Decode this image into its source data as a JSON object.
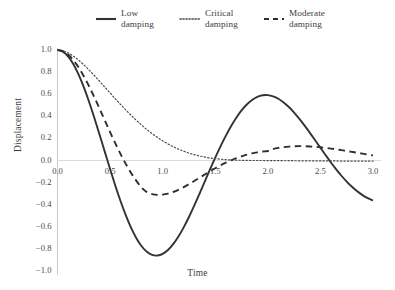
{
  "chart_data": {
    "type": "line",
    "title": "",
    "subtitle": "",
    "xlabel": "Time",
    "ylabel": "Displacement",
    "xlim": [
      0.0,
      3.0
    ],
    "ylim": [
      -1.0,
      1.0
    ],
    "grid": false,
    "zero_line": true,
    "legend_position": "top-center",
    "xticks": [
      "0.0",
      "0.5",
      "1.0",
      "1.5",
      "2.0",
      "2.5",
      "3.0"
    ],
    "xtick_values": [
      0.0,
      0.5,
      1.0,
      1.5,
      2.0,
      2.5,
      3.0
    ],
    "yticks": [
      "1.0",
      "0.8",
      "0.6",
      "0.4",
      "0.2",
      "0.0",
      "−0.2",
      "−0.4",
      "−0.6",
      "−0.8",
      "−1.0"
    ],
    "ytick_values": [
      1.0,
      0.8,
      0.6,
      0.4,
      0.2,
      0.0,
      -0.2,
      -0.4,
      -0.6,
      -0.8,
      -1.0
    ],
    "x": [
      0.0,
      0.05,
      0.1,
      0.15,
      0.2,
      0.25,
      0.3,
      0.35,
      0.4,
      0.45,
      0.5,
      0.55,
      0.6,
      0.65,
      0.7,
      0.75,
      0.8,
      0.85,
      0.9,
      0.95,
      1.0,
      1.05,
      1.1,
      1.15,
      1.2,
      1.25,
      1.3,
      1.35,
      1.4,
      1.45,
      1.5,
      1.55,
      1.6,
      1.65,
      1.7,
      1.75,
      1.8,
      1.85,
      1.9,
      1.95,
      2.0,
      2.05,
      2.1,
      2.15,
      2.2,
      2.25,
      2.3,
      2.35,
      2.4,
      2.45,
      2.5,
      2.55,
      2.6,
      2.65,
      2.7,
      2.75,
      2.8,
      2.85,
      2.9,
      2.95,
      3.0
    ],
    "series": [
      {
        "name": "Low damping",
        "legend_label": "Low\ndamping",
        "style": "solid",
        "color": "#333333",
        "width": 1.9,
        "values": [
          1.0,
          0.985,
          0.942,
          0.873,
          0.779,
          0.664,
          0.532,
          0.387,
          0.234,
          0.078,
          -0.077,
          -0.228,
          -0.369,
          -0.497,
          -0.61,
          -0.703,
          -0.776,
          -0.826,
          -0.854,
          -0.86,
          -0.845,
          -0.81,
          -0.757,
          -0.688,
          -0.605,
          -0.511,
          -0.409,
          -0.301,
          -0.191,
          -0.081,
          0.026,
          0.128,
          0.223,
          0.31,
          0.387,
          0.453,
          0.507,
          0.548,
          0.576,
          0.59,
          0.592,
          0.581,
          0.559,
          0.526,
          0.484,
          0.434,
          0.377,
          0.315,
          0.25,
          0.183,
          0.115,
          0.048,
          -0.018,
          -0.08,
          -0.138,
          -0.191,
          -0.238,
          -0.279,
          -0.313,
          -0.341,
          -0.362
        ],
        "annotations": {
          "first_min": {
            "x": 1.33,
            "y": -0.87
          },
          "second_max": {
            "x": 2.03,
            "y": 0.8
          },
          "zero_crossings": [
            0.51,
            1.56,
            2.57
          ]
        }
      },
      {
        "name": "Critical damping",
        "legend_label": "Critical\ndamping",
        "style": "dotted",
        "color": "#4a4a4a",
        "width": 1.2,
        "values": [
          1.0,
          0.993,
          0.974,
          0.945,
          0.909,
          0.866,
          0.819,
          0.769,
          0.717,
          0.664,
          0.611,
          0.558,
          0.507,
          0.457,
          0.409,
          0.363,
          0.32,
          0.28,
          0.243,
          0.209,
          0.178,
          0.15,
          0.125,
          0.103,
          0.084,
          0.067,
          0.053,
          0.041,
          0.031,
          0.023,
          0.017,
          0.012,
          0.008,
          0.005,
          0.003,
          0.002,
          0.001,
          0.0,
          0.0,
          0.0,
          -0.001,
          -0.001,
          -0.001,
          -0.002,
          -0.002,
          -0.002,
          -0.003,
          -0.003,
          -0.003,
          -0.003,
          -0.004,
          -0.004,
          -0.004,
          -0.004,
          -0.005,
          -0.005,
          -0.005,
          -0.005,
          -0.005,
          -0.005,
          -0.006
        ]
      },
      {
        "name": "Moderate damping",
        "legend_label": "Moderate\ndamping",
        "style": "dashed",
        "color": "#2e2e2e",
        "width": 1.9,
        "values": [
          1.0,
          0.99,
          0.959,
          0.909,
          0.843,
          0.763,
          0.672,
          0.573,
          0.469,
          0.363,
          0.257,
          0.155,
          0.058,
          -0.032,
          -0.113,
          -0.184,
          -0.245,
          -0.286,
          -0.304,
          -0.311,
          -0.309,
          -0.3,
          -0.285,
          -0.265,
          -0.241,
          -0.214,
          -0.186,
          -0.156,
          -0.127,
          -0.098,
          -0.07,
          -0.044,
          -0.02,
          0.002,
          0.021,
          0.038,
          0.053,
          0.065,
          0.074,
          0.081,
          0.086,
          0.103,
          0.114,
          0.121,
          0.126,
          0.129,
          0.13,
          0.129,
          0.127,
          0.124,
          0.12,
          0.114,
          0.108,
          0.101,
          0.094,
          0.086,
          0.078,
          0.07,
          0.062,
          0.054,
          0.046
        ],
        "annotations": {
          "first_min": {
            "x": 1.17,
            "y": -0.31
          },
          "second_max": {
            "x": 2.28,
            "y": 0.13
          }
        }
      }
    ]
  },
  "legend": {
    "entries": [
      {
        "label": "Low\ndamping",
        "style": "solid"
      },
      {
        "label": "Critical\ndamping",
        "style": "dotted"
      },
      {
        "label": "Moderate\ndamping",
        "style": "dashed"
      }
    ]
  },
  "axes": {
    "ylabel": "Displacement",
    "xlabel": "Time",
    "axis_color": "#cccccc",
    "zero_line_color": "#dcdcdc"
  }
}
